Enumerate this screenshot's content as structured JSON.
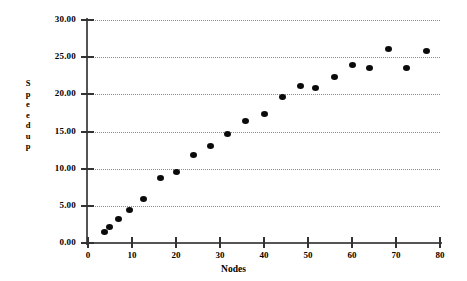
{
  "chart_data": {
    "type": "scatter",
    "title": "",
    "xlabel": "Nodes",
    "ylabel": "Speedup",
    "xlim": [
      0,
      80
    ],
    "ylim": [
      0,
      30
    ],
    "grid": true,
    "legend": false,
    "x_ticks": [
      "0",
      "10",
      "20",
      "30",
      "40",
      "50",
      "60",
      "70",
      "80"
    ],
    "x_tick_values": [
      0,
      10,
      20,
      30,
      40,
      50,
      60,
      70,
      80
    ],
    "y_ticks": [
      "0.00",
      "5.00",
      "10.00",
      "15.00",
      "20.00",
      "25.00",
      "30.00"
    ],
    "y_tick_values": [
      0,
      5,
      10,
      15,
      20,
      25,
      30
    ],
    "marker": "filled-circle",
    "marker_color": "#0a0a0a",
    "grid_color": "#8b8b8b",
    "axis_color": "#555555",
    "series": [
      {
        "name": "Speedup",
        "points": [
          [
            3.7,
            1.5
          ],
          [
            4.8,
            2.1
          ],
          [
            7.0,
            3.2
          ],
          [
            9.5,
            4.4
          ],
          [
            12.5,
            5.9
          ],
          [
            16.5,
            8.7
          ],
          [
            20.2,
            9.6
          ],
          [
            24.0,
            11.8
          ],
          [
            27.8,
            13.0
          ],
          [
            31.8,
            14.6
          ],
          [
            35.8,
            16.4
          ],
          [
            40.2,
            17.4
          ],
          [
            44.3,
            19.6
          ],
          [
            48.3,
            21.1
          ],
          [
            51.8,
            20.8
          ],
          [
            56.0,
            22.3
          ],
          [
            60.0,
            23.9
          ],
          [
            64.0,
            23.6
          ],
          [
            68.3,
            26.1
          ],
          [
            72.3,
            23.6
          ],
          [
            77.0,
            25.8
          ]
        ]
      }
    ]
  },
  "y_axis_title_letters": [
    "S",
    "p",
    "e",
    "e",
    "d",
    "u",
    "p"
  ]
}
